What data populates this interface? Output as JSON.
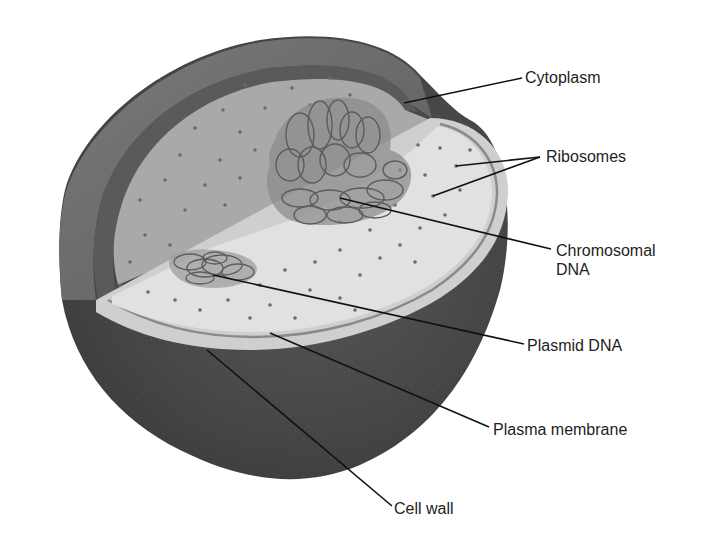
{
  "diagram": {
    "colors": {
      "background": "#ffffff",
      "cell_wall_outer": "#4a4a4a",
      "cell_wall_rim": "#6e6e6e",
      "cell_wall_inner_band": "#5a5a5a",
      "membrane_light": "#cfcfcf",
      "cytoplasm_back": "#a9a9a9",
      "cytoplasm_front": "#e1e1e1",
      "nucleoid_fill": "#8c8c8c",
      "dna_stroke": "#5c5c5c",
      "ribosome": "#6a6a6a",
      "leader_line": "#111111",
      "label_text": "#1e1e1e"
    },
    "labels": [
      {
        "id": "cytoplasm",
        "text": "Cytoplasm",
        "x": 525,
        "y": 68,
        "line_from": [
          522,
          78
        ],
        "line_to": [
          404,
          103
        ]
      },
      {
        "id": "ribosomes",
        "text": "Ribosomes",
        "x": 546,
        "y": 147,
        "line_from": [
          540,
          157
        ],
        "lines_to": [
          [
            456,
            166
          ],
          [
            433,
            196
          ]
        ]
      },
      {
        "id": "chromosomal-dna",
        "text": "Chromosomal",
        "text2": "DNA",
        "x": 556,
        "y": 241,
        "line_from": [
          551,
          249
        ],
        "line_to": [
          340,
          198
        ]
      },
      {
        "id": "plasmid-dna",
        "text": "Plasmid DNA",
        "x": 527,
        "y": 336,
        "line_from": [
          524,
          344
        ],
        "line_to": [
          213,
          275
        ]
      },
      {
        "id": "plasma-membrane",
        "text": "Plasma membrane",
        "x": 493,
        "y": 420,
        "line_from": [
          489,
          427
        ],
        "line_to": [
          270,
          333
        ]
      },
      {
        "id": "cell-wall",
        "text": "Cell wall",
        "x": 394,
        "y": 499,
        "line_from": [
          392,
          506
        ],
        "line_to": [
          207,
          350
        ]
      }
    ]
  }
}
